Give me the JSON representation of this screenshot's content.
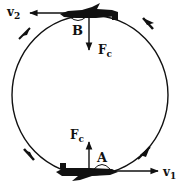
{
  "diagram": {
    "title": "",
    "colors": {
      "ink": "#111111",
      "background": "#ffffff"
    },
    "loop": {
      "shape": "circle",
      "motion_direction": "counterclockwise"
    },
    "points": [
      {
        "id": "B",
        "label": "B",
        "position": "top"
      },
      {
        "id": "A",
        "label": "A",
        "position": "bottom"
      }
    ],
    "vectors": {
      "v2": {
        "base": "v",
        "sub": "2",
        "direction": "left",
        "at": "B"
      },
      "v1": {
        "base": "v",
        "sub": "1",
        "direction": "right",
        "at": "A"
      },
      "fc_top": {
        "base": "F",
        "sub": "c",
        "direction": "down",
        "at": "B"
      },
      "fc_bottom": {
        "base": "F",
        "sub": "c",
        "direction": "up",
        "at": "A"
      }
    },
    "airplanes": [
      {
        "at": "B",
        "orientation": "inverted, flying left"
      },
      {
        "at": "A",
        "orientation": "upright, flying right"
      }
    ],
    "direction_arrows": [
      "top-left",
      "top-right",
      "bottom-left",
      "bottom-right"
    ]
  }
}
